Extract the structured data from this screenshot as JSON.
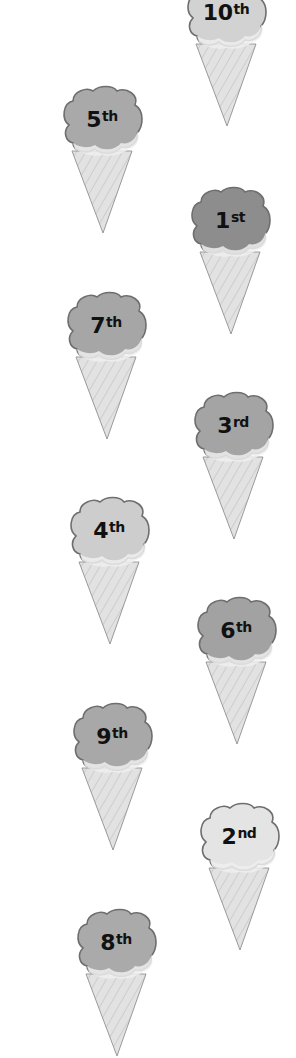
{
  "cones": [
    {
      "num": "10",
      "suffix": "th",
      "left": 183,
      "top": -22,
      "scoop_color": "#d2d2d2",
      "rank": 10
    },
    {
      "num": "5",
      "suffix": "th",
      "left": 59,
      "top": 85,
      "scoop_color": "#a9a9a9",
      "rank": 5
    },
    {
      "num": "1",
      "suffix": "st",
      "left": 187,
      "top": 186,
      "scoop_color": "#8d8d8d",
      "rank": 1
    },
    {
      "num": "7",
      "suffix": "th",
      "left": 63,
      "top": 291,
      "scoop_color": "#a6a6a6",
      "rank": 7
    },
    {
      "num": "3",
      "suffix": "rd",
      "left": 190,
      "top": 391,
      "scoop_color": "#a4a4a4",
      "rank": 3
    },
    {
      "num": "4",
      "suffix": "th",
      "left": 66,
      "top": 496,
      "scoop_color": "#cdcdcd",
      "rank": 4
    },
    {
      "num": "6",
      "suffix": "th",
      "left": 193,
      "top": 596,
      "scoop_color": "#a2a2a2",
      "rank": 6
    },
    {
      "num": "9",
      "suffix": "th",
      "left": 69,
      "top": 702,
      "scoop_color": "#a8a8a8",
      "rank": 9
    },
    {
      "num": "2",
      "suffix": "nd",
      "left": 196,
      "top": 802,
      "scoop_color": "#e4e4e4",
      "rank": 2
    },
    {
      "num": "8",
      "suffix": "th",
      "left": 73,
      "top": 908,
      "scoop_color": "#aaaaaa",
      "rank": 8
    }
  ],
  "colors": {
    "outline": "#6e6e6e",
    "cone_fill": "#e2e2e2",
    "cone_line": "#b8b8b8",
    "drip": "#efefef",
    "text": "#111111"
  }
}
